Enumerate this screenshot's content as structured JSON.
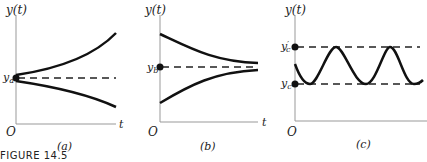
{
  "figure": {
    "caption": "FIGURE 14.5",
    "panels": [
      {
        "id": "a",
        "label": "(a)",
        "y_axis_label": "y(t)",
        "x_axis_label": "t",
        "origin_label": "O",
        "equilibrium_label": "y_a",
        "description": "Unstable equilibrium: paths diverge from y_a"
      },
      {
        "id": "b",
        "label": "(b)",
        "y_axis_label": "y(t)",
        "x_axis_label": "t",
        "origin_label": "O",
        "equilibrium_label": "y_b",
        "description": "Stable equilibrium: paths converge to y_b"
      },
      {
        "id": "c",
        "label": "(c)",
        "y_axis_label": "y(t)",
        "x_axis_label": "t",
        "origin_label": "O",
        "upper_label": "y'_c",
        "lower_label": "y_c",
        "description": "Oscillation between y_c and y'_c"
      }
    ]
  }
}
